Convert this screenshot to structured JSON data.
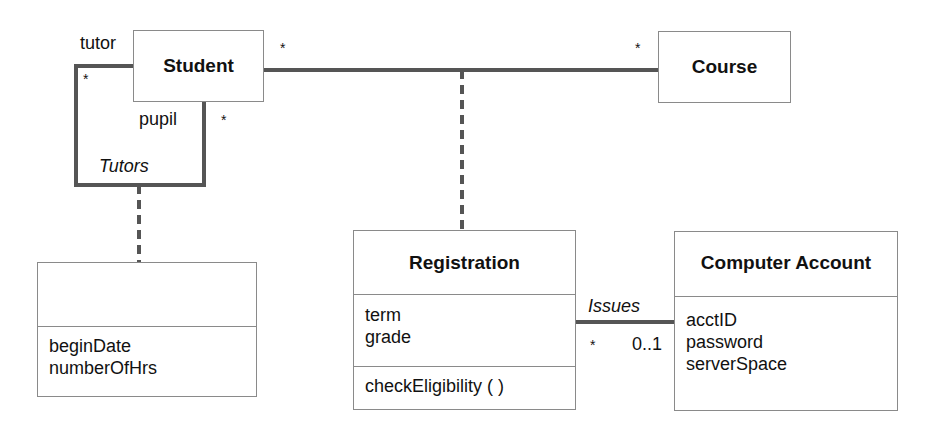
{
  "diagram": {
    "type": "UML class diagram",
    "line_color": "#555555",
    "border_color": "#8a8a8a"
  },
  "classes": {
    "student": {
      "name": "Student"
    },
    "course": {
      "name": "Course"
    },
    "tutors_assoc_class": {
      "name": "",
      "attributes": [
        "beginDate",
        "numberOfHrs"
      ]
    },
    "registration": {
      "name": "Registration",
      "attributes": [
        "term",
        "grade"
      ],
      "operations": [
        "checkEligibility ( )"
      ]
    },
    "computer_account": {
      "name": "Computer Account",
      "attributes": [
        "acctID",
        "password",
        "serverSpace"
      ]
    }
  },
  "associations": {
    "tutors": {
      "name": "Tutors",
      "role_tutor": "tutor",
      "role_pupil": "pupil",
      "mult_tutor": "*",
      "mult_pupil": "*"
    },
    "student_course": {
      "mult_student": "*",
      "mult_course": "*"
    },
    "issues": {
      "name": "Issues",
      "mult_registration": "*",
      "mult_account": "0..1"
    }
  }
}
